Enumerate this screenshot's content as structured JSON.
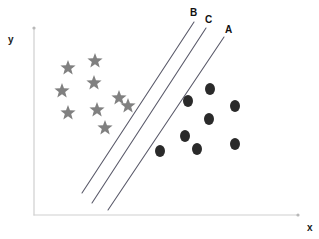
{
  "figure": {
    "axes": {
      "x_label": "x",
      "y_label": "y",
      "axis_color": "#cfcfcf",
      "origin": [
        34,
        215
      ],
      "x_axis_end": [
        298,
        215
      ],
      "y_axis_end": [
        34,
        28
      ]
    },
    "boundary_lines": [
      {
        "label": "B",
        "color": "#5a5a6a",
        "x1": 82,
        "y1": 193,
        "x2": 194,
        "y2": 22,
        "label_x": 190,
        "label_y": 8
      },
      {
        "label": "C",
        "color": "#5a5a6a",
        "x1": 92,
        "y1": 203,
        "x2": 206,
        "y2": 28,
        "label_x": 205,
        "label_y": 15
      },
      {
        "label": "A",
        "color": "#5a5a6a",
        "x1": 108,
        "y1": 210,
        "x2": 224,
        "y2": 37,
        "label_x": 225,
        "label_y": 25
      }
    ]
  },
  "chart_data": {
    "type": "scatter",
    "title": "",
    "xlabel": "x",
    "ylabel": "y",
    "grid": false,
    "legend": null,
    "xlim": [
      34,
      298
    ],
    "ylim": [
      28,
      215
    ],
    "annotations": [
      {
        "text": "B",
        "x": 190,
        "y": 8
      },
      {
        "text": "C",
        "x": 205,
        "y": 15
      },
      {
        "text": "A",
        "x": 225,
        "y": 25
      }
    ],
    "lines": [
      {
        "name": "B",
        "x": [
          82,
          194
        ],
        "y": [
          193,
          22
        ]
      },
      {
        "name": "C",
        "x": [
          92,
          206
        ],
        "y": [
          203,
          28
        ]
      },
      {
        "name": "A",
        "x": [
          108,
          224
        ],
        "y": [
          210,
          37
        ]
      }
    ],
    "series": [
      {
        "name": "star-class",
        "marker": "star",
        "color": "#808080",
        "size": 13,
        "points": [
          [
            68,
            68
          ],
          [
            95,
            61
          ],
          [
            62,
            91
          ],
          [
            94,
            83
          ],
          [
            68,
            113
          ],
          [
            97,
            110
          ],
          [
            105,
            128
          ],
          [
            119,
            98
          ],
          [
            128,
            106
          ]
        ]
      },
      {
        "name": "circle-class",
        "marker": "circle",
        "color": "#2a2a2a",
        "size": 13,
        "points": [
          [
            210,
            89
          ],
          [
            188,
            101
          ],
          [
            235,
            106
          ],
          [
            209,
            119
          ],
          [
            185,
            136
          ],
          [
            235,
            144
          ],
          [
            197,
            149
          ],
          [
            160,
            151
          ]
        ]
      }
    ]
  }
}
